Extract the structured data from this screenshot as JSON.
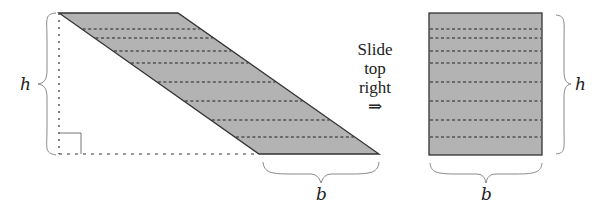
{
  "diagram": {
    "colors": {
      "fill": "#b3b3b3",
      "outline": "#333333",
      "dash": "#222222",
      "brace": "#888888",
      "background": "#ffffff"
    },
    "parallelogram": {
      "points": [
        [
          59,
          13
        ],
        [
          178,
          13
        ],
        [
          379,
          154
        ],
        [
          259,
          154
        ]
      ],
      "dashed_lines_y": [
        29,
        38,
        51,
        63,
        82,
        101,
        120,
        137
      ]
    },
    "rectangle": {
      "x": 429,
      "y": 13,
      "width": 113,
      "height": 142,
      "dashed_lines_y": [
        29,
        38,
        51,
        63,
        82,
        101,
        120,
        137
      ]
    },
    "labels": {
      "height_left": "h",
      "height_right": "h",
      "base_left": "b",
      "base_right": "b"
    },
    "instruction": {
      "line1": "Slide",
      "line2": "top",
      "line3": "right",
      "arrow": "⇒"
    }
  }
}
